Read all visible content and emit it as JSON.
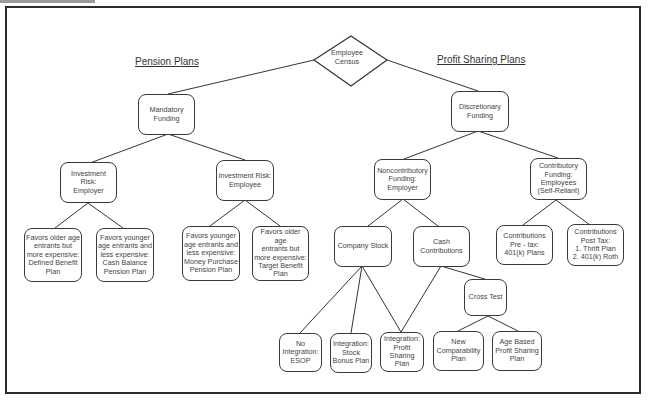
{
  "diagram": {
    "root": {
      "id": "employee-census",
      "label": "Employee\nCensus",
      "shape": "diamond"
    },
    "section_titles": {
      "pension": "Pension Plans",
      "profit_sharing": "Profit Sharing Plans"
    },
    "nodes": {
      "mandatory_funding": "Mandatory\nFunding",
      "discretionary_funding": "Discretionary\nFunding",
      "risk_employer": "Investment Risk:\nEmployer",
      "risk_employee": "Investment Risk:\nEmployee",
      "defined_benefit": "Favors older age\nentrants but\nmore expensive:\nDefined Benefit\nPlan",
      "cash_balance": "Favors younger\nage entrants and\nless expensive:\nCash Balance\nPension Plan",
      "money_purchase": "Favors younger\nage entrants and\nless expensive:\nMoney Purchase\nPension Plan",
      "target_benefit": "Favors older age\nentrants but\nmore expensive:\nTarget Benefit\nPlan",
      "noncontributory": "Noncontributory\nFunding:\nEmployer",
      "contributory": "Contributory\nFunding:\nEmployees\n(Self-Reliant)",
      "company_stock": "Company Stock",
      "cash_contributions": "Cash\nContributions",
      "pretax": "Contributions\nPre - tax:\n401(k) Plans",
      "posttax": "Contributions\nPost Tax:\n1. Thrift Plan\n2. 401(k) Roth",
      "cross_test": "Cross Test",
      "esop": "No\nIntegration:\nESOP",
      "stock_bonus": "Integration:\nStock\nBonus Plan",
      "profit_sharing_plan": "Integration:\nProfit\nSharing\nPlan",
      "new_comparability": "New\nComparability\nPlan",
      "age_based": "Age Based\nProfit Sharing\nPlan"
    },
    "edges": [
      [
        "employee-census",
        "mandatory_funding"
      ],
      [
        "employee-census",
        "discretionary_funding"
      ],
      [
        "mandatory_funding",
        "risk_employer"
      ],
      [
        "mandatory_funding",
        "risk_employee"
      ],
      [
        "risk_employer",
        "defined_benefit"
      ],
      [
        "risk_employer",
        "cash_balance"
      ],
      [
        "risk_employee",
        "money_purchase"
      ],
      [
        "risk_employee",
        "target_benefit"
      ],
      [
        "discretionary_funding",
        "noncontributory"
      ],
      [
        "discretionary_funding",
        "contributory"
      ],
      [
        "noncontributory",
        "company_stock"
      ],
      [
        "noncontributory",
        "cash_contributions"
      ],
      [
        "contributory",
        "pretax"
      ],
      [
        "contributory",
        "posttax"
      ],
      [
        "company_stock",
        "esop"
      ],
      [
        "company_stock",
        "stock_bonus"
      ],
      [
        "company_stock",
        "profit_sharing_plan"
      ],
      [
        "cash_contributions",
        "profit_sharing_plan"
      ],
      [
        "cash_contributions",
        "cross_test"
      ],
      [
        "cross_test",
        "new_comparability"
      ],
      [
        "cross_test",
        "age_based"
      ]
    ]
  }
}
